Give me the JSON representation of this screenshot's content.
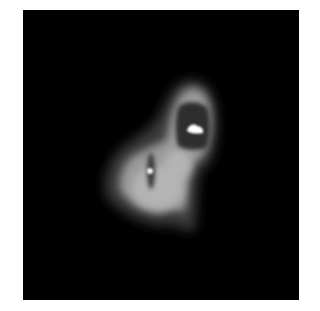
{
  "image": {
    "description": "Grayscale blurred two-lobed bright object on black square background",
    "background_color": "#ffffff",
    "frame_color": "#000000",
    "palette": {
      "halo": "#3a3a3a",
      "ring": "#9a9a9a",
      "bright": "#b4b4b4",
      "core_dark": "#2e2e2e",
      "hotspot": "#ffffff"
    },
    "features": [
      {
        "name": "upper-lobe",
        "center": [
          195,
          118
        ],
        "hotspot": [
          195,
          129
        ]
      },
      {
        "name": "lower-lobe",
        "center": [
          152,
          185
        ],
        "hotspot": [
          150,
          171
        ]
      }
    ]
  }
}
